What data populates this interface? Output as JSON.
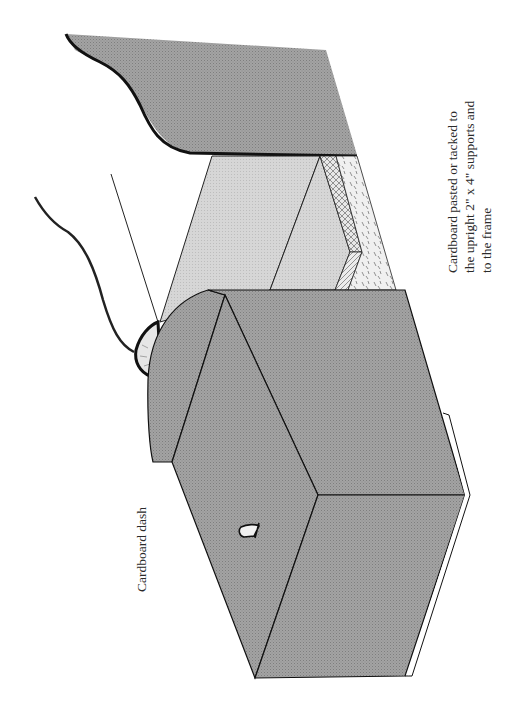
{
  "figure": {
    "orientation": "rotated 90 degrees counter-clockwise",
    "colors": {
      "background": "#ffffff",
      "cardboard_dark": "#9a9a9a",
      "cardboard_light": "#d2d2d2",
      "outline": "#111111",
      "wood_strip": "#e4e4e4"
    }
  },
  "labels": {
    "right_annotation": {
      "lines": [
        "Cardboard pasted  or tacked  to",
        "the upright 2\" x 4\" supports and",
        "to the frame"
      ]
    },
    "left_annotation": {
      "text": "Cardboard dash"
    }
  }
}
